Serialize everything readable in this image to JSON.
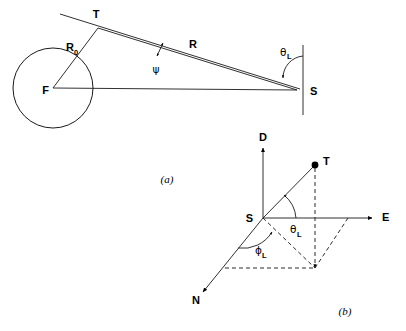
{
  "figure": {
    "panels": [
      {
        "id": "panel-a",
        "caption": "(a)",
        "description": "Geometry of a tangent ray grazing a spherical body",
        "labels": {
          "center": "F",
          "tangent_point": "T",
          "station": "S",
          "radius": "R",
          "radius_sub": "0",
          "range": "R",
          "grazing_angle": "ψ",
          "local_elevation": "θ",
          "local_elevation_sub": "L"
        }
      },
      {
        "id": "panel-b",
        "caption": "(b)",
        "description": "Local East-North-Down coordinate frame at the station with the target direction",
        "labels": {
          "up_axis": "D",
          "east_axis": "E",
          "north_axis": "N",
          "origin": "S",
          "target": "T",
          "elevation": "θ",
          "elevation_sub": "L",
          "azimuth": "ϕ",
          "azimuth_sub": "L"
        }
      }
    ]
  },
  "colors": {
    "line": "#1a1a1a",
    "dashed": "#2b2b2b",
    "background": "#ffffff",
    "marker": "#000000"
  }
}
